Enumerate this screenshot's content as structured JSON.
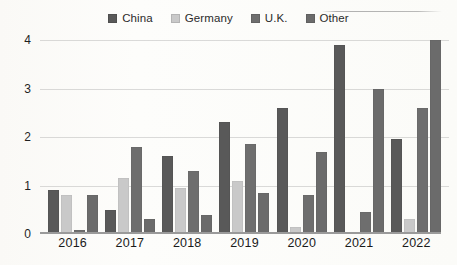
{
  "chart_data": {
    "type": "bar",
    "title": "",
    "xlabel": "",
    "ylabel": "",
    "categories": [
      "2016",
      "2017",
      "2018",
      "2019",
      "2020",
      "2021",
      "2022"
    ],
    "ylim": [
      0,
      4
    ],
    "yticks": [
      0,
      1,
      2,
      3,
      4
    ],
    "grid": true,
    "legend_position": "top-center",
    "series": [
      {
        "name": "China",
        "color": "#595959",
        "values": [
          0.9,
          0.5,
          1.6,
          2.3,
          2.6,
          3.9,
          1.95
        ]
      },
      {
        "name": "Germany",
        "color": "#c9c9c9",
        "values": [
          0.8,
          1.15,
          0.95,
          1.1,
          0.15,
          0.0,
          0.3
        ]
      },
      {
        "name": "U.K.",
        "color": "#6e6e6e",
        "values": [
          0.08,
          1.8,
          1.3,
          1.85,
          0.8,
          0.45,
          2.6
        ]
      },
      {
        "name": "Other",
        "color": "#6b6b6b",
        "values": [
          0.8,
          0.3,
          0.4,
          0.85,
          1.7,
          3.0,
          4.0
        ]
      }
    ]
  },
  "legend": {
    "items": [
      {
        "label": "China",
        "color": "#595959",
        "swatch": "legend-swatch-icon"
      },
      {
        "label": "Germany",
        "color": "#c9c9c9",
        "swatch": "legend-swatch-icon"
      },
      {
        "label": "U.K.",
        "color": "#6e6e6e",
        "swatch": "legend-swatch-icon"
      },
      {
        "label": "Other",
        "color": "#6b6b6b",
        "swatch": "legend-swatch-icon"
      }
    ]
  },
  "axes": {
    "y_labels": [
      "4",
      "3",
      "2",
      "1",
      "0"
    ],
    "x_labels": [
      "2016",
      "2017",
      "2018",
      "2019",
      "2020",
      "2021",
      "2022"
    ]
  }
}
